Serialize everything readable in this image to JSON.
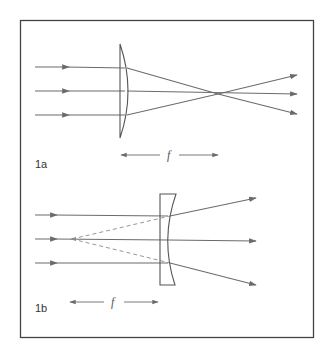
{
  "figure": {
    "frame": {
      "x": 20,
      "y": 20,
      "width": 293,
      "height": 317,
      "stroke": "#444444"
    },
    "colors": {
      "ray": "#6b6b6b",
      "lens": "#555555",
      "frame": "#444444",
      "text": "#333333"
    },
    "panels": [
      {
        "id": "1a",
        "label": "1a",
        "lens_type": "converging (plano-convex)",
        "focal_label": "f",
        "incoming_rays_y": [
          67,
          91,
          115
        ],
        "focal_point": [
          218,
          94
        ],
        "outgoing_ray_ends": [
          [
            297,
            75
          ],
          [
            297,
            94
          ],
          [
            297,
            114
          ]
        ]
      },
      {
        "id": "1b",
        "label": "1b",
        "lens_type": "diverging (plano-concave)",
        "focal_label": "f",
        "incoming_rays_y": [
          215,
          239,
          263
        ],
        "virtual_focal_point": [
          72,
          239
        ],
        "outgoing_ray_ends": [
          [
            256,
            198
          ],
          [
            256,
            241
          ],
          [
            256,
            285
          ]
        ]
      }
    ]
  }
}
